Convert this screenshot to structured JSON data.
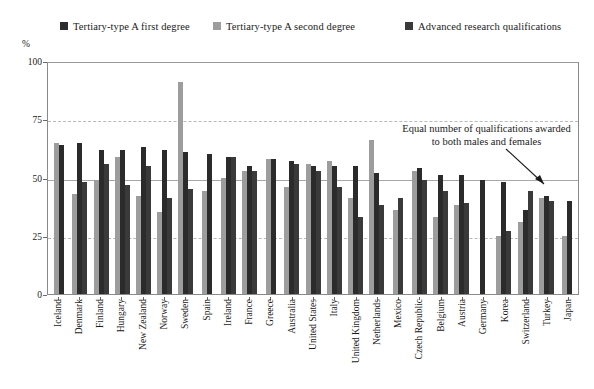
{
  "axis": {
    "unit_label": "%",
    "yticks": [
      0,
      25,
      50,
      75,
      100
    ],
    "ytick_labels": [
      "0",
      "25",
      "50",
      "75",
      "100"
    ]
  },
  "annotation": {
    "line1": "Equal number of qualifications awarded",
    "line2": "to both males and females",
    "arrow_icon": "down-right-arrow-icon"
  },
  "legend": {
    "items": [
      {
        "label": "Tertiary-type A first degree",
        "color": "#2b2b2b",
        "swatch_icon": "square-swatch-icon"
      },
      {
        "label": "Tertiary-type A second degree",
        "color": "#9d9d9d",
        "swatch_icon": "square-swatch-icon"
      },
      {
        "label": "Advanced research qualifications",
        "color": "#3a3a3a",
        "swatch_icon": "square-swatch-icon"
      }
    ]
  },
  "chart_data": {
    "type": "bar",
    "title": "",
    "xlabel": "",
    "ylabel": "%",
    "ylim": [
      0,
      100
    ],
    "grid": true,
    "legend_position": "top",
    "reference_line": 50,
    "categories": [
      "Iceland",
      "Denmark",
      "Finland",
      "Hungary",
      "New Zealand",
      "Norway",
      "Sweden",
      "Spain",
      "Ireland",
      "France",
      "Greece",
      "Australia",
      "United States",
      "Italy",
      "United Kingdom",
      "Netherlands",
      "Mexico",
      "Czech Republic",
      "Belgium",
      "Austria",
      "Germany",
      "Korea",
      "Switzerland",
      "Turkey",
      "Japan"
    ],
    "series": [
      {
        "name": "Tertiary-type A second degree",
        "color": "#9d9d9d",
        "values": [
          65,
          43,
          49,
          59,
          42,
          35,
          91,
          44,
          50,
          53,
          58,
          46,
          56,
          57,
          41,
          66,
          36,
          53,
          33,
          38,
          null,
          25,
          31,
          41,
          25
        ]
      },
      {
        "name": "Tertiary-type A first degree",
        "color": "#2b2b2b",
        "values": [
          64,
          65,
          62,
          62,
          63,
          62,
          61,
          60,
          59,
          55,
          58,
          57,
          55,
          55,
          55,
          52,
          null,
          54,
          51,
          51,
          49,
          48,
          36,
          42,
          40
        ]
      },
      {
        "name": "Advanced research qualifications",
        "color": "#3a3a3a",
        "values": [
          null,
          48,
          56,
          47,
          55,
          41,
          45,
          null,
          59,
          53,
          null,
          56,
          53,
          46,
          33,
          38,
          41,
          49,
          44,
          39,
          null,
          27,
          44,
          40,
          null
        ]
      }
    ],
    "annotation_text": "Equal number of qualifications awarded to both males and females"
  }
}
